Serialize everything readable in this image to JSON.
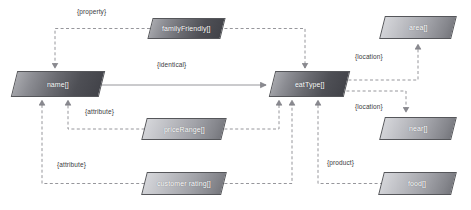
{
  "diagram": {
    "type": "graph",
    "title": "",
    "background": "#ffffff",
    "node_fill_light": "#c9cace",
    "node_fill_dark": "#4e4f55",
    "node_border": "#55565a",
    "edge_color": "#8a8a90",
    "node_text_color": "#ffffff",
    "label_text_color": "#3b3b3e"
  },
  "nodes": [
    {
      "id": "familyFriendly",
      "label": "familyFriendly[]",
      "x": 150,
      "y": 18,
      "w": 73,
      "h": 21,
      "shade": "dark"
    },
    {
      "id": "name",
      "label": "name[]",
      "x": 14,
      "y": 71,
      "w": 88,
      "h": 26,
      "shade": "dark"
    },
    {
      "id": "eatType",
      "label": "eatType[]",
      "x": 272,
      "y": 71,
      "w": 75,
      "h": 26,
      "shade": "dark"
    },
    {
      "id": "area",
      "label": "area[]",
      "x": 382,
      "y": 16,
      "w": 72,
      "h": 23,
      "shade": "light"
    },
    {
      "id": "near",
      "label": "near[]",
      "x": 382,
      "y": 117,
      "w": 72,
      "h": 23,
      "shade": "light"
    },
    {
      "id": "priceRange",
      "label": "priceRange[]",
      "x": 144,
      "y": 118,
      "w": 80,
      "h": 22,
      "shade": "light"
    },
    {
      "id": "food",
      "label": "food[]",
      "x": 381,
      "y": 172,
      "w": 73,
      "h": 23,
      "shade": "light"
    },
    {
      "id": "customerRating",
      "label": "customer rating[]",
      "x": 144,
      "y": 172,
      "w": 80,
      "h": 23,
      "shade": "light"
    }
  ],
  "edges": [
    {
      "id": "familyFriendly-to-name",
      "source": "familyFriendly",
      "target": "name",
      "label": "{property}",
      "style": "dashed"
    },
    {
      "id": "familyFriendly-to-eatType",
      "source": "familyFriendly",
      "target": "eatType",
      "label": "",
      "style": "dashed"
    },
    {
      "id": "name-to-eatType",
      "source": "name",
      "target": "eatType",
      "label": "{identical}",
      "style": "solid"
    },
    {
      "id": "priceRange-to-name",
      "source": "priceRange",
      "target": "name",
      "label": "{attribute}",
      "style": "dashed"
    },
    {
      "id": "priceRange-to-eatType",
      "source": "priceRange",
      "target": "eatType",
      "label": "",
      "style": "dashed"
    },
    {
      "id": "customerRating-to-name",
      "source": "customerRating",
      "target": "name",
      "label": "{attribute}",
      "style": "dashed"
    },
    {
      "id": "customerRating-to-eatType",
      "source": "customerRating",
      "target": "eatType",
      "label": "",
      "style": "dashed"
    },
    {
      "id": "eatType-to-area",
      "source": "eatType",
      "target": "area",
      "label": "{location}",
      "style": "dashed"
    },
    {
      "id": "eatType-to-near",
      "source": "eatType",
      "target": "near",
      "label": "{location}",
      "style": "dashed"
    },
    {
      "id": "food-to-eatType",
      "source": "food",
      "target": "eatType",
      "label": "{product}",
      "style": "dashed"
    }
  ],
  "edge_labels": [
    {
      "id": "label-property",
      "text": "{property}",
      "x": 77,
      "y": 8
    },
    {
      "id": "label-identical",
      "text": "{identical}",
      "x": 157,
      "y": 61
    },
    {
      "id": "label-attribute-1",
      "text": "{attribute}",
      "x": 85,
      "y": 108
    },
    {
      "id": "label-attribute-2",
      "text": "{attribute}",
      "x": 57,
      "y": 161
    },
    {
      "id": "label-location-1",
      "text": "{location}",
      "x": 355,
      "y": 53
    },
    {
      "id": "label-location-2",
      "text": "{location}",
      "x": 355,
      "y": 103
    },
    {
      "id": "label-product",
      "text": "{product}",
      "x": 327,
      "y": 159
    }
  ]
}
